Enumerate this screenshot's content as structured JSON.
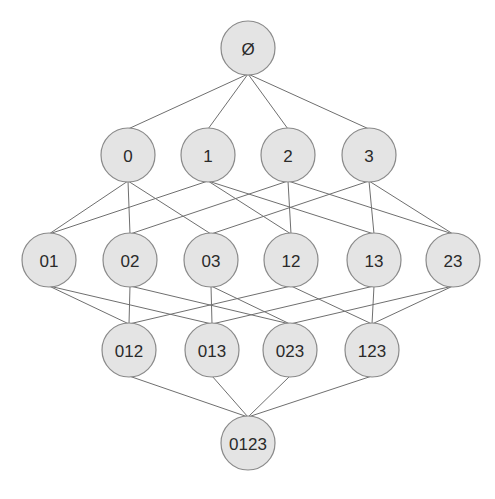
{
  "style": {
    "node_fill": "#e4e4e4",
    "node_stroke": "#8a8a8a",
    "edge_color": "#6f6f6f",
    "label_color": "#2a2a2a",
    "node_radius": 27
  },
  "nodes": [
    {
      "id": "empty",
      "label": "Ø",
      "x": 248,
      "y": 48,
      "level": 0
    },
    {
      "id": "0",
      "label": "0",
      "x": 128,
      "y": 155,
      "level": 1
    },
    {
      "id": "1",
      "label": "1",
      "x": 208,
      "y": 155,
      "level": 1
    },
    {
      "id": "2",
      "label": "2",
      "x": 288,
      "y": 155,
      "level": 1
    },
    {
      "id": "3",
      "label": "3",
      "x": 369,
      "y": 155,
      "level": 1
    },
    {
      "id": "01",
      "label": "01",
      "x": 49,
      "y": 260,
      "level": 2
    },
    {
      "id": "02",
      "label": "02",
      "x": 130,
      "y": 260,
      "level": 2
    },
    {
      "id": "03",
      "label": "03",
      "x": 211,
      "y": 260,
      "level": 2
    },
    {
      "id": "12",
      "label": "12",
      "x": 291,
      "y": 260,
      "level": 2
    },
    {
      "id": "13",
      "label": "13",
      "x": 374,
      "y": 260,
      "level": 2
    },
    {
      "id": "23",
      "label": "23",
      "x": 453,
      "y": 260,
      "level": 2
    },
    {
      "id": "012",
      "label": "012",
      "x": 129,
      "y": 350,
      "level": 3
    },
    {
      "id": "013",
      "label": "013",
      "x": 212,
      "y": 350,
      "level": 3
    },
    {
      "id": "023",
      "label": "023",
      "x": 290,
      "y": 350,
      "level": 3
    },
    {
      "id": "123",
      "label": "123",
      "x": 372,
      "y": 350,
      "level": 3
    },
    {
      "id": "0123",
      "label": "0123",
      "x": 248,
      "y": 443,
      "level": 4
    }
  ],
  "edges": [
    [
      "empty",
      "0"
    ],
    [
      "empty",
      "1"
    ],
    [
      "empty",
      "2"
    ],
    [
      "empty",
      "3"
    ],
    [
      "0",
      "01"
    ],
    [
      "0",
      "02"
    ],
    [
      "0",
      "03"
    ],
    [
      "1",
      "01"
    ],
    [
      "1",
      "12"
    ],
    [
      "1",
      "13"
    ],
    [
      "2",
      "02"
    ],
    [
      "2",
      "12"
    ],
    [
      "2",
      "23"
    ],
    [
      "3",
      "03"
    ],
    [
      "3",
      "13"
    ],
    [
      "3",
      "23"
    ],
    [
      "01",
      "012"
    ],
    [
      "01",
      "013"
    ],
    [
      "02",
      "012"
    ],
    [
      "02",
      "023"
    ],
    [
      "03",
      "013"
    ],
    [
      "03",
      "023"
    ],
    [
      "12",
      "012"
    ],
    [
      "12",
      "123"
    ],
    [
      "13",
      "013"
    ],
    [
      "13",
      "123"
    ],
    [
      "23",
      "023"
    ],
    [
      "23",
      "123"
    ],
    [
      "012",
      "0123"
    ],
    [
      "013",
      "0123"
    ],
    [
      "023",
      "0123"
    ],
    [
      "123",
      "0123"
    ]
  ]
}
